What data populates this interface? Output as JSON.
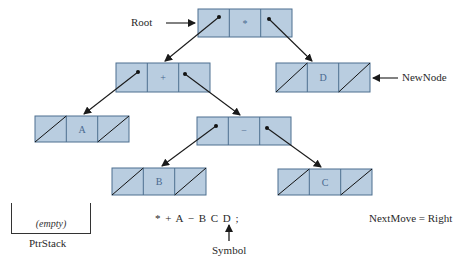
{
  "labels": {
    "root": "Root",
    "new_node": "NewNode",
    "ptr_stack": "PtrStack",
    "stack_content": "(empty)",
    "expression": "* + A − B C D ;",
    "symbol": "Symbol",
    "next_move": "NextMove = Right"
  },
  "nodes": [
    {
      "id": "root",
      "value": "*",
      "left": "pointer",
      "right": "pointer"
    },
    {
      "id": "plus",
      "value": "+",
      "left": "pointer",
      "right": "pointer"
    },
    {
      "id": "newnode-d",
      "value": "D",
      "left": "nil",
      "right": "nil"
    },
    {
      "id": "a",
      "value": "A",
      "left": "nil",
      "right": "nil"
    },
    {
      "id": "minus",
      "value": "−",
      "left": "pointer",
      "right": "pointer"
    },
    {
      "id": "b",
      "value": "B",
      "left": "nil",
      "right": "nil"
    },
    {
      "id": "c",
      "value": "C",
      "left": "nil",
      "right": "nil"
    }
  ],
  "colors": {
    "cell_fill": "#b9cde0",
    "cell_border": "#4d6f8f",
    "line": "#1a1a1a"
  }
}
